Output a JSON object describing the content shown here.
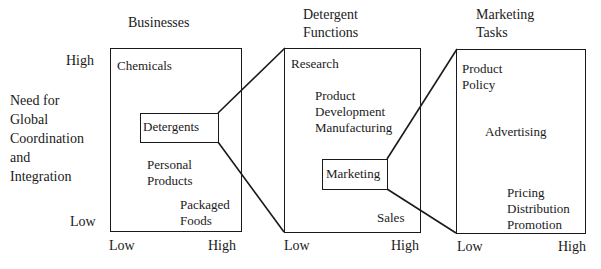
{
  "y_axis": {
    "title": "Need for\nGlobal\nCoordination\nand\nIntegration",
    "high_label": "High",
    "low_label": "Low"
  },
  "panels": [
    {
      "title": "Businesses",
      "x_low": "Low",
      "x_high": "High",
      "items": [
        "Chemicals",
        "Detergents",
        "Personal\nProducts",
        "Packaged\nFoods"
      ],
      "highlighted": "Detergents"
    },
    {
      "title": "Detergent\nFunctions",
      "x_low": "Low",
      "x_high": "High",
      "items": [
        "Research",
        "Product\nDevelopment\nManufacturing",
        "Marketing",
        "Sales"
      ],
      "highlighted": "Marketing"
    },
    {
      "title": "Marketing\nTasks",
      "x_low": "Low",
      "x_high": "High",
      "items": [
        "Product\nPolicy",
        "Advertising",
        "Pricing\nDistribution\nPromotion"
      ]
    }
  ],
  "colors": {
    "ink": "#1a1a1a",
    "background": "#ffffff"
  }
}
